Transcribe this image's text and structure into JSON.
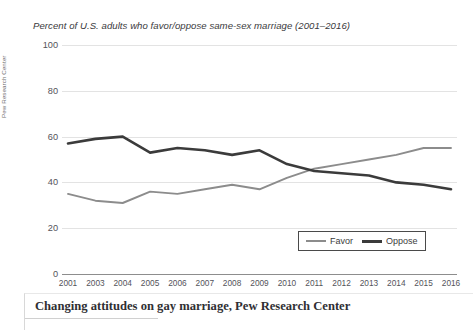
{
  "figure": {
    "source_label": "Pew Research Center",
    "caption": "Changing attitudes on gay marriage, Pew Research Center"
  },
  "chart_data": {
    "type": "line",
    "title": "Percent of U.S. adults who favor/oppose same-sex marriage (2001–2016)",
    "xlabel": "",
    "ylabel": "",
    "ylim": [
      0,
      100
    ],
    "yticks": [
      0,
      20,
      40,
      60,
      80,
      100
    ],
    "grid": true,
    "legend_position": "bottom-right",
    "categories": [
      "2001",
      "2003",
      "2004",
      "2005",
      "2006",
      "2007",
      "2008",
      "2009",
      "2010",
      "2011",
      "2012",
      "2013",
      "2014",
      "2015",
      "2016"
    ],
    "series": [
      {
        "name": "Favor",
        "color": "#8c8c8c",
        "values": [
          35,
          32,
          31,
          36,
          35,
          37,
          39,
          37,
          42,
          46,
          48,
          50,
          52,
          55,
          55
        ]
      },
      {
        "name": "Oppose",
        "color": "#3b3b3b",
        "values": [
          57,
          59,
          60,
          53,
          55,
          54,
          52,
          54,
          48,
          45,
          44,
          43,
          40,
          39,
          37
        ]
      }
    ]
  }
}
